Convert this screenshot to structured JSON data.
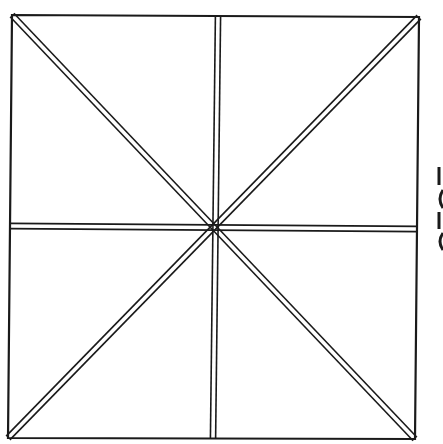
{
  "diagram": {
    "stroke_color": "#1a1a1a",
    "background": "#ffffff",
    "square": {
      "top_left": [
        12,
        15
      ],
      "top_right": [
        419,
        17
      ],
      "bottom_right": [
        415,
        439
      ],
      "bottom_left": [
        8,
        438
      ]
    },
    "center": [
      216,
      229
    ],
    "lines": [
      {
        "name": "diagonal-tl-br",
        "from": [
          12,
          15
        ],
        "to": [
          415,
          439
        ],
        "style": "double"
      },
      {
        "name": "diagonal-tr-bl",
        "from": [
          419,
          17
        ],
        "to": [
          8,
          438
        ],
        "style": "double"
      },
      {
        "name": "vertical-median",
        "from": [
          218,
          16
        ],
        "to": [
          213,
          439
        ],
        "style": "double"
      },
      {
        "name": "horizontal-median",
        "from": [
          10,
          226
        ],
        "to": [
          417,
          229
        ],
        "style": "double"
      }
    ],
    "edge_fragments": [
      {
        "name": "cropped-glyph-1",
        "x": 439,
        "y_from": 167,
        "y_to": 185,
        "shape": "bar"
      },
      {
        "name": "cropped-glyph-2",
        "x": 439,
        "y_from": 190,
        "y_to": 208,
        "shape": "curve"
      },
      {
        "name": "cropped-glyph-3",
        "x": 439,
        "y_from": 212,
        "y_to": 229,
        "shape": "bar"
      },
      {
        "name": "cropped-glyph-4",
        "x": 439,
        "y_from": 233,
        "y_to": 250,
        "shape": "curve"
      }
    ]
  }
}
